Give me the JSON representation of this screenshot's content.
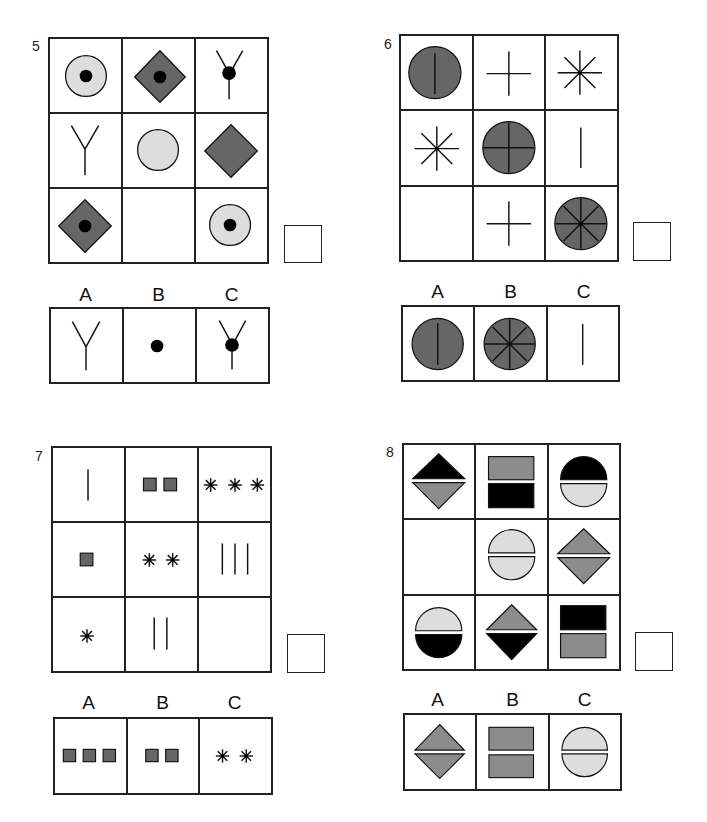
{
  "colors": {
    "dark_gray": "#666666",
    "light_gray": "#dddddd",
    "medium_gray": "#8c8c8c",
    "black": "#000000",
    "line": "#222222"
  },
  "puzzles": [
    {
      "number": "5",
      "grid": [
        [
          "light-circle-with-dot",
          "dark-diamond-with-dot",
          "y-fork-with-dot"
        ],
        [
          "y-fork",
          "light-circle",
          "dark-diamond"
        ],
        [
          "dark-diamond-with-dot",
          "empty",
          "light-circle-with-dot"
        ]
      ],
      "options": [
        {
          "label": "A",
          "figure": "y-fork"
        },
        {
          "label": "B",
          "figure": "black-dot"
        },
        {
          "label": "C",
          "figure": "y-fork-with-dot"
        }
      ]
    },
    {
      "number": "6",
      "grid": [
        [
          "dark-circle-vertical-line",
          "plus",
          "eight-point-star"
        ],
        [
          "eight-point-star",
          "dark-circle-plus",
          "vertical-line"
        ],
        [
          "empty",
          "plus",
          "dark-circle-eight-point-star"
        ]
      ],
      "options": [
        {
          "label": "A",
          "figure": "dark-circle-vertical-line"
        },
        {
          "label": "B",
          "figure": "dark-circle-eight-point-star"
        },
        {
          "label": "C",
          "figure": "vertical-line"
        }
      ]
    },
    {
      "number": "7",
      "grid": [
        [
          "1-vertical-line",
          "2-gray-squares",
          "3-asterisks"
        ],
        [
          "1-gray-square",
          "2-asterisks",
          "3-vertical-lines"
        ],
        [
          "1-asterisk",
          "2-vertical-lines",
          "empty"
        ]
      ],
      "options": [
        {
          "label": "A",
          "figure": "3-gray-squares"
        },
        {
          "label": "B",
          "figure": "2-gray-squares"
        },
        {
          "label": "C",
          "figure": "2-asterisks"
        }
      ]
    },
    {
      "number": "8",
      "grid": [
        [
          "black-triangle-over-gray-triangle",
          "gray-rect-over-black-rect",
          "black-semicircle-over-light-semicircle"
        ],
        [
          "empty",
          "light-semicircle-over-light-semicircle",
          "gray-triangle-over-gray-triangle"
        ],
        [
          "light-semicircle-over-black-semicircle",
          "gray-triangle-over-black-triangle",
          "black-rect-over-gray-rect"
        ]
      ],
      "options": [
        {
          "label": "A",
          "figure": "gray-triangle-over-gray-triangle"
        },
        {
          "label": "B",
          "figure": "gray-rect-over-gray-rect"
        },
        {
          "label": "C",
          "figure": "light-semicircle-over-light-semicircle"
        }
      ]
    }
  ]
}
